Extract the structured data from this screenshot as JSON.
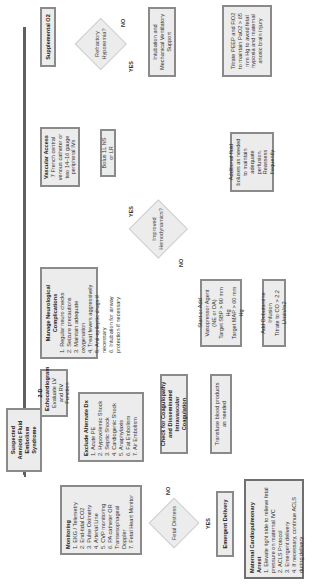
{
  "colors": {
    "box_fill": "#ececec",
    "box_border": "#8a8a8a",
    "line": "#606060"
  },
  "start": {
    "label": "Suspected Amniotic Fluid Embolism Syndrome"
  },
  "supplemental_o2": {
    "title": "Supplemental O2"
  },
  "refractory_hypoxemia": {
    "label": "Refractory Hypoxemia?",
    "no": "NO",
    "yes": "YES"
  },
  "intubation": {
    "label": "Intubation and Mechanical Ventilatory Support"
  },
  "titrate_peep": {
    "label": "Titrate PEEP and FiO2 to maintain PaO2 > 65 mm Hg to avoid fetal hypoxia and maternal anoxic brain injury"
  },
  "vascular_access": {
    "title": "Vascular Access",
    "body": "7 French central venous catheter or two 14–16 gauge peripheral IVs"
  },
  "bolus": {
    "label": "Bolus 1L NS or LR"
  },
  "neuro": {
    "title": "Manage Neurological Complications",
    "items": [
      "1. Regular neuro checks",
      "2. Seizure precautions",
      "3. Maintain adequate oxygenation",
      "4. Treat fevers aggressively",
      "5. Anti-epileptic drugs if necessary",
      "6. Intubation for airway protection if necessary"
    ]
  },
  "improved_hemo": {
    "label": "Improved Hemodynamics?",
    "yes": "YES",
    "no": "NO"
  },
  "additional_fluid": {
    "label": "Additional fluid boluses as needed to maintain adequate perfusion. Reassess frequently"
  },
  "vasopressor": {
    "label": "Start or Add Vasopressor Agent (NE or DA)",
    "targets": [
      "Target SBP > 90 mm Hg",
      "Target MAP > 60 mm Hg"
    ]
  },
  "dobutamine": {
    "label": "Add Dobutamine Infusion",
    "body": "Titrate to CO > 2.2 L/min/m2"
  },
  "echo": {
    "title": "2-D Echocardiogram",
    "body": "Evaluate LV and RV Function"
  },
  "exclude_dx": {
    "title": "Exclude Alternate Dx",
    "items": [
      "1. Acute PE",
      "2. Hypovolemic Shock",
      "3. Septic Shock",
      "4. Cardiogenic Shock",
      "5. Anaphylaxis",
      "6. Fat Embolism",
      "7. Air Embolism"
    ]
  },
  "coagulopathy": {
    "label": "Check for Coagulopathy and Disseminated Intravascular Coagulation"
  },
  "transfuse": {
    "label": "Transfuse blood products as needed"
  },
  "monitoring": {
    "title": "Monitoring",
    "items": [
      "1. EKG / Telemetry",
      "2. End-tidal CO2",
      "3. Pulse Oximetry",
      "4. Arterial Line",
      "5. CVP monitoring",
      "6. PA catheter OR Transesophageal Doppler",
      "7. Fetal Heart Monitor"
    ]
  },
  "fetal_distress": {
    "label": "Fetal Distress",
    "yes": "YES",
    "no": "NO"
  },
  "emergent_delivery": {
    "label": "Emergent Delivery"
  },
  "cardiac_arrest": {
    "title": "Maternal Cardiopulmonary Arrest",
    "items": [
      "1. Elevate right side to relieve fetal pressure on maternal IVC",
      "2. ACLS Protocol",
      "3. Emergent delivery",
      "4. If necessary, continue ACLS during delivery"
    ]
  }
}
